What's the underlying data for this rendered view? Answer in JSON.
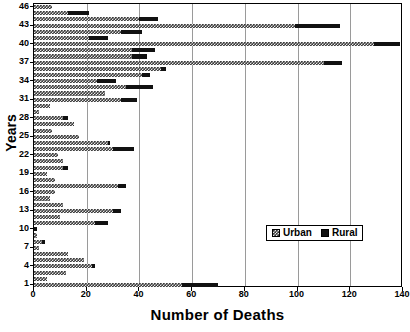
{
  "chart_data": {
    "type": "bar",
    "orientation": "horizontal",
    "stacked": true,
    "title": "",
    "xlabel": "Number of Deaths",
    "ylabel": "Years",
    "xlim": [
      0,
      140
    ],
    "ylim_categories": 46,
    "xticks": [
      0,
      20,
      40,
      60,
      80,
      100,
      120,
      140
    ],
    "yticks": [
      1,
      4,
      7,
      10,
      13,
      16,
      19,
      22,
      25,
      28,
      31,
      34,
      37,
      40,
      43,
      46
    ],
    "grid": "vertical",
    "legend_position": "bottom-right",
    "categories": [
      1,
      2,
      3,
      4,
      5,
      6,
      7,
      8,
      9,
      10,
      11,
      12,
      13,
      14,
      15,
      16,
      17,
      18,
      19,
      20,
      21,
      22,
      23,
      24,
      25,
      26,
      27,
      28,
      29,
      30,
      31,
      32,
      33,
      34,
      35,
      36,
      37,
      38,
      39,
      40,
      41,
      42,
      43,
      44,
      45,
      46
    ],
    "series": [
      {
        "name": "Urban",
        "color": "#3a3a3a",
        "pattern": "checkered",
        "values": [
          56,
          5,
          12,
          22,
          19,
          13,
          2,
          3,
          1,
          0,
          23,
          10,
          30,
          11,
          6,
          8,
          32,
          8,
          5,
          11,
          11,
          9,
          30,
          28,
          17,
          7,
          15,
          11,
          2,
          6,
          33,
          27,
          35,
          24,
          41,
          48,
          110,
          37,
          37,
          129,
          21,
          33,
          99,
          40,
          13,
          7
        ]
      },
      {
        "name": "Rural",
        "color": "#111111",
        "pattern": "solid",
        "values": [
          14,
          0,
          0,
          1,
          0,
          0,
          0,
          1,
          0,
          1,
          5,
          0,
          3,
          0,
          0,
          0,
          3,
          0,
          0,
          2,
          0,
          0,
          8,
          1,
          0,
          0,
          0,
          2,
          0,
          0,
          6,
          0,
          10,
          7,
          3,
          2,
          7,
          6,
          9,
          10,
          7,
          8,
          17,
          7,
          8,
          0
        ]
      }
    ]
  },
  "legend": {
    "items": [
      {
        "label": "Urban"
      },
      {
        "label": "Rural"
      }
    ]
  },
  "axes": {
    "x_title": "Number of Deaths",
    "y_title": "Years"
  }
}
